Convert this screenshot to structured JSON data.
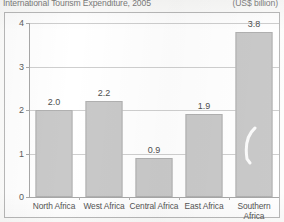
{
  "header": {
    "title": "International Tourism Expenditure, 2005",
    "unit": "(US$ billion)"
  },
  "chart_data": {
    "type": "bar",
    "title": "International Tourism Expenditure, 2005",
    "subtitle": "(US$ billion)",
    "xlabel": "",
    "ylabel": "",
    "ylim": [
      0,
      4
    ],
    "yticks": [
      "0",
      "1",
      "2",
      "3",
      "4"
    ],
    "grid": true,
    "legend": "none",
    "categories": [
      "North Africa",
      "West Africa",
      "Central Africa",
      "East Africa",
      "Southern Africa"
    ],
    "values": [
      2.0,
      2.2,
      0.9,
      1.9,
      3.8
    ],
    "value_labels": [
      "2.0",
      "2.2",
      "0.9",
      "1.9",
      "3.8"
    ],
    "bar_color": "#c9c9c9",
    "bar_border_color": "#b0b0b0",
    "grid_color": "#cfcfcf",
    "axis_color": "#a8a8a8"
  }
}
